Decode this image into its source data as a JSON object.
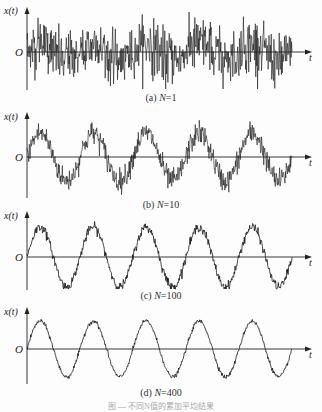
{
  "figure_caption": "图 — 不同N值的累加平均结果",
  "chart_data": [
    {
      "type": "line",
      "id": "a",
      "title": "(a) N=1",
      "caption_prefix": "(a) ",
      "caption_var": "N",
      "caption_value": "=1",
      "xlabel": "t",
      "ylabel": "x(t)",
      "origin_label": "O",
      "N": 1,
      "signal": "sine + noise",
      "sine_cycles": 5,
      "sine_amplitude": 1.0,
      "noise_std": 1.0,
      "grid": false
    },
    {
      "type": "line",
      "id": "b",
      "title": "(b) N=10",
      "caption_prefix": "(b) ",
      "caption_var": "N",
      "caption_value": "=10",
      "xlabel": "t",
      "ylabel": "x(t)",
      "origin_label": "O",
      "N": 10,
      "signal": "sine + noise/sqrt(N)",
      "sine_cycles": 5,
      "sine_amplitude": 1.0,
      "noise_std": 0.32,
      "grid": false
    },
    {
      "type": "line",
      "id": "c",
      "title": "(c) N=100",
      "caption_prefix": "(c) ",
      "caption_var": "N",
      "caption_value": "=100",
      "xlabel": "t",
      "ylabel": "x(t)",
      "origin_label": "O",
      "N": 100,
      "signal": "sine + noise/sqrt(N)",
      "sine_cycles": 5,
      "sine_amplitude": 1.0,
      "noise_std": 0.1,
      "grid": false
    },
    {
      "type": "line",
      "id": "d",
      "title": "(d) N=400",
      "caption_prefix": "(d) ",
      "caption_var": "N",
      "caption_value": "=400",
      "xlabel": "t",
      "ylabel": "x(t)",
      "origin_label": "O",
      "N": 400,
      "signal": "sine + noise/sqrt(N)",
      "sine_cycles": 5,
      "sine_amplitude": 1.0,
      "noise_std": 0.05,
      "grid": false
    }
  ]
}
